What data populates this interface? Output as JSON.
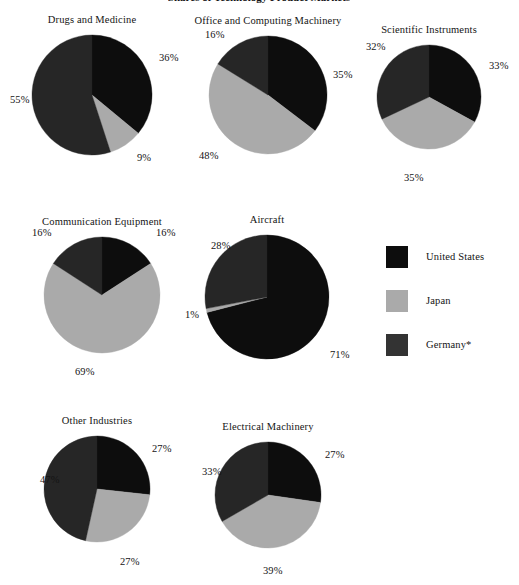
{
  "figure": {
    "title": "Shares of Technology Product Markets",
    "background_color": "#ffffff",
    "text_color": "#141414"
  },
  "legend": {
    "position": "middle-right",
    "items": [
      {
        "label": "United States",
        "color": "#0d0d0d",
        "swatch_name": "legend-swatch-united-states"
      },
      {
        "label": "Japan",
        "color": "#aaaaaa",
        "swatch_name": "legend-swatch-japan"
      },
      {
        "label": "Germany*",
        "color": "#333333",
        "swatch_name": "legend-swatch-germany"
      }
    ]
  },
  "chart_data": [
    {
      "type": "pie",
      "title": "Drugs and Medicine",
      "labels": [
        "United States",
        "Japan",
        "Germany*"
      ],
      "values": [
        36,
        9,
        55
      ],
      "value_labels": [
        "36%",
        "9%",
        "55%"
      ],
      "colors": [
        "#0d0d0d",
        "#aaaaaa",
        "#262626"
      ],
      "center": [
        92,
        95
      ],
      "radius": 60,
      "start_angle_deg": 0,
      "label_positions": [
        [
          159,
          52
        ],
        [
          137,
          152
        ],
        [
          10,
          94
        ]
      ]
    },
    {
      "type": "pie",
      "title": "Office and Computing Machinery",
      "labels": [
        "United States",
        "Japan",
        "Germany*"
      ],
      "values": [
        35,
        48,
        16
      ],
      "value_labels": [
        "35%",
        "48%",
        "16%"
      ],
      "colors": [
        "#0d0d0d",
        "#aaaaaa",
        "#262626"
      ],
      "center": [
        268,
        95
      ],
      "radius": 59,
      "start_angle_deg": 0,
      "label_positions": [
        [
          333,
          69
        ],
        [
          199,
          150
        ],
        [
          205,
          29
        ]
      ]
    },
    {
      "type": "pie",
      "title": "Scientific Instruments",
      "labels": [
        "United States",
        "Japan",
        "Germany*"
      ],
      "values": [
        33,
        35,
        32
      ],
      "value_labels": [
        "33%",
        "35%",
        "32%"
      ],
      "colors": [
        "#0d0d0d",
        "#aaaaaa",
        "#262626"
      ],
      "center": [
        429,
        97
      ],
      "radius": 52,
      "start_angle_deg": 0,
      "label_positions": [
        [
          489,
          60
        ],
        [
          404,
          172
        ],
        [
          366,
          41
        ]
      ]
    },
    {
      "type": "pie",
      "title": "Communication Equipment",
      "labels": [
        "United States",
        "Japan",
        "Germany*"
      ],
      "values": [
        16,
        69,
        16
      ],
      "value_labels": [
        "16%",
        "69%",
        "16%"
      ],
      "colors": [
        "#0d0d0d",
        "#aaaaaa",
        "#262626"
      ],
      "center": [
        102,
        295
      ],
      "radius": 58,
      "start_angle_deg": 0,
      "label_positions": [
        [
          156,
          227
        ],
        [
          75,
          366
        ],
        [
          32,
          227
        ]
      ]
    },
    {
      "type": "pie",
      "title": "Aircraft",
      "labels": [
        "United States",
        "Japan",
        "Germany*"
      ],
      "values": [
        71,
        1,
        28
      ],
      "value_labels": [
        "71%",
        "1%",
        "28%"
      ],
      "colors": [
        "#0d0d0d",
        "#aaaaaa",
        "#262626"
      ],
      "center": [
        267,
        297
      ],
      "radius": 62,
      "start_angle_deg": 0,
      "label_positions": [
        [
          330,
          349
        ],
        [
          185,
          309
        ],
        [
          211,
          240
        ]
      ]
    },
    {
      "type": "pie",
      "title": "Other Industries",
      "labels": [
        "United States",
        "Japan",
        "Germany*"
      ],
      "values": [
        27,
        27,
        47
      ],
      "value_labels": [
        "27%",
        "27%",
        "47%"
      ],
      "colors": [
        "#0d0d0d",
        "#aaaaaa",
        "#262626"
      ],
      "center": [
        97,
        489
      ],
      "radius": 53,
      "start_angle_deg": 0,
      "label_positions": [
        [
          152,
          443
        ],
        [
          120,
          556
        ],
        [
          40,
          474
        ]
      ]
    },
    {
      "type": "pie",
      "title": "Electrical Machinery",
      "labels": [
        "United States",
        "Japan",
        "Germany*"
      ],
      "values": [
        27,
        39,
        33
      ],
      "value_labels": [
        "27%",
        "39%",
        "33%"
      ],
      "colors": [
        "#0d0d0d",
        "#aaaaaa",
        "#262626"
      ],
      "center": [
        268,
        495
      ],
      "radius": 53,
      "start_angle_deg": 0,
      "label_positions": [
        [
          325,
          449
        ],
        [
          263,
          565
        ],
        [
          202,
          466
        ]
      ]
    }
  ]
}
